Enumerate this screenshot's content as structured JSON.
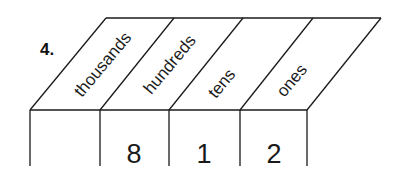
{
  "problem": {
    "number": "4.",
    "columns": [
      {
        "header": "thousands",
        "value": ""
      },
      {
        "header": "hundreds",
        "value": "8"
      },
      {
        "header": "tens",
        "value": "1"
      },
      {
        "header": "ones",
        "value": "2"
      }
    ]
  },
  "colors": {
    "line": "#1a1a1a",
    "background": "#ffffff"
  }
}
